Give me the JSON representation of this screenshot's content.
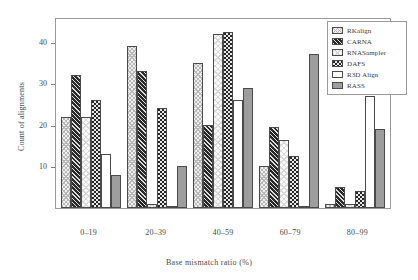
{
  "chart_data": {
    "type": "bar",
    "title": "",
    "xlabel": "Base  mismatch ratio (%)",
    "ylabel": "Count of alignments",
    "categories": [
      "0–19",
      "20–39",
      "40–59",
      "60–79",
      "80–99"
    ],
    "series": [
      {
        "name": "RKalign",
        "values": [
          22,
          39,
          35,
          10,
          1
        ]
      },
      {
        "name": "CARNA",
        "values": [
          32,
          33,
          20,
          19.5,
          5
        ]
      },
      {
        "name": "RNASampler",
        "values": [
          22,
          1,
          42,
          16.5,
          1
        ]
      },
      {
        "name": "DAFS",
        "values": [
          26,
          24,
          42.5,
          12.5,
          4
        ]
      },
      {
        "name": "R3D Align",
        "values": [
          13,
          0.5,
          26,
          0,
          27
        ]
      },
      {
        "name": "RASS",
        "values": [
          8,
          10,
          29,
          37,
          19
        ]
      }
    ],
    "ylim": [
      0,
      46
    ],
    "yticks": [
      10,
      20,
      30,
      40
    ],
    "ytick_labels": [
      "10",
      "20",
      "30",
      "40"
    ],
    "grid": false,
    "legend_position": "top-right",
    "legend_entries": [
      "RKalign",
      "CARNA",
      "RNASampler",
      "DAFS",
      "R3D Align",
      "RASS"
    ]
  }
}
